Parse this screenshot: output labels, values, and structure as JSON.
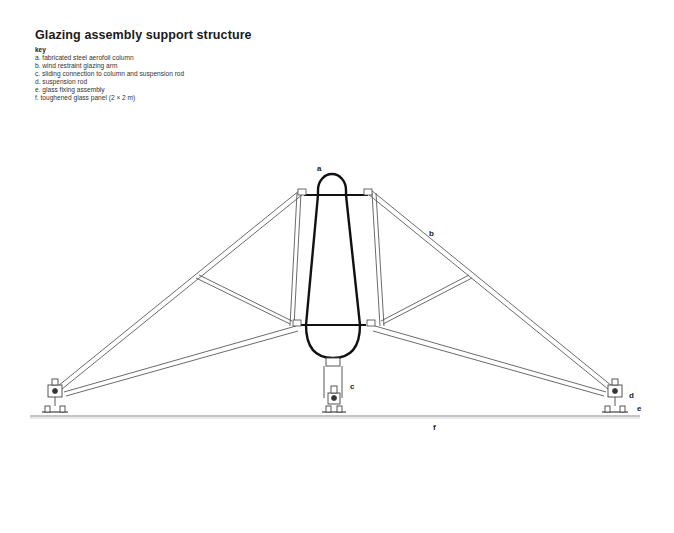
{
  "title": "Glazing assembly support structure",
  "key": {
    "heading": "key",
    "items": [
      {
        "letter": "a",
        "text": "a. fabricated steel aerofoil column"
      },
      {
        "letter": "b",
        "text": "b. wind restraint glazing arm"
      },
      {
        "letter": "c",
        "text": "c. sliding connection to column and suspension rod"
      },
      {
        "letter": "d",
        "text": "d. suspension rod"
      },
      {
        "letter": "e",
        "text": "e. glass fixing assembly"
      },
      {
        "letter": "f",
        "text": "f. toughened glass panel (2 × 2 m)"
      }
    ]
  },
  "diagram_labels": {
    "a": "a",
    "b": "b",
    "c": "c",
    "d": "d",
    "e": "e",
    "f": "f"
  },
  "colors": {
    "line": "#555555",
    "column": "#111111",
    "ground": "#888888"
  }
}
